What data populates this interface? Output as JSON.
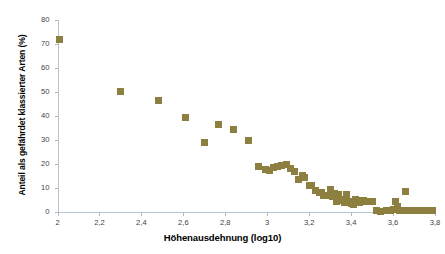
{
  "chart_data": {
    "type": "scatter",
    "title": "",
    "xlabel": "Höhenausdehnung (log10)",
    "ylabel": "Anteil als gefährdet klassierter Arten (%)",
    "xlim": [
      2,
      3.8
    ],
    "ylim": [
      0,
      80
    ],
    "grid": false,
    "legend": false,
    "marker": {
      "shape": "square",
      "color": "#8d7f40",
      "size_px": 7
    },
    "xticks": [
      2,
      2.2,
      2.4,
      2.6,
      2.8,
      3,
      3.2,
      3.4,
      3.6,
      3.8
    ],
    "xtick_labels": [
      "2",
      "2,2",
      "2,4",
      "2,6",
      "2,8",
      "3",
      "3,2",
      "3,4",
      "3,6",
      "3,8"
    ],
    "yticks": [
      0,
      10,
      20,
      30,
      40,
      50,
      60,
      70,
      80
    ],
    "ytick_labels": [
      "0",
      "10",
      "20",
      "30",
      "40",
      "50",
      "60",
      "70",
      "80"
    ],
    "series": [
      {
        "name": "Anteil gefährdeter Arten",
        "points": [
          [
            2.01,
            71.9
          ],
          [
            2.3,
            50.3
          ],
          [
            2.48,
            46.6
          ],
          [
            2.61,
            39.3
          ],
          [
            2.7,
            28.8
          ],
          [
            2.77,
            36.4
          ],
          [
            2.84,
            34.3
          ],
          [
            2.91,
            29.6
          ],
          [
            2.96,
            18.9
          ],
          [
            2.99,
            17.8
          ],
          [
            3.01,
            17.4
          ],
          [
            3.03,
            18.6
          ],
          [
            3.05,
            18.8
          ],
          [
            3.07,
            19.2
          ],
          [
            3.09,
            19.6
          ],
          [
            3.11,
            18.2
          ],
          [
            3.13,
            16.8
          ],
          [
            3.15,
            13.6
          ],
          [
            3.17,
            15.2
          ],
          [
            3.18,
            14.4
          ],
          [
            3.2,
            11.2
          ],
          [
            3.21,
            10.9
          ],
          [
            3.23,
            9.0
          ],
          [
            3.25,
            8.1
          ],
          [
            3.26,
            8.3
          ],
          [
            3.27,
            6.9
          ],
          [
            3.29,
            7.0
          ],
          [
            3.3,
            9.3
          ],
          [
            3.31,
            6.3
          ],
          [
            3.32,
            7.6
          ],
          [
            3.33,
            4.4
          ],
          [
            3.34,
            7.3
          ],
          [
            3.35,
            5.2
          ],
          [
            3.36,
            4.6
          ],
          [
            3.37,
            4.0
          ],
          [
            3.38,
            7.5
          ],
          [
            3.39,
            4.5
          ],
          [
            3.4,
            3.6
          ],
          [
            3.41,
            3.2
          ],
          [
            3.42,
            5.2
          ],
          [
            3.43,
            4.3
          ],
          [
            3.44,
            3.9
          ],
          [
            3.45,
            4.6
          ],
          [
            3.46,
            4.8
          ],
          [
            3.47,
            4.5
          ],
          [
            3.48,
            4.3
          ],
          [
            3.49,
            4.4
          ],
          [
            3.5,
            4.2
          ],
          [
            3.52,
            0.6
          ],
          [
            3.54,
            0.4
          ],
          [
            3.57,
            0.6
          ],
          [
            3.59,
            0.5
          ],
          [
            3.6,
            1.0
          ],
          [
            3.61,
            4.4
          ],
          [
            3.62,
            2.2
          ],
          [
            3.63,
            0.5
          ],
          [
            3.65,
            0.5
          ],
          [
            3.66,
            8.6
          ],
          [
            3.67,
            0.5
          ],
          [
            3.69,
            0.5
          ],
          [
            3.71,
            0.5
          ],
          [
            3.73,
            0.5
          ],
          [
            3.75,
            0.5
          ],
          [
            3.77,
            0.5
          ],
          [
            3.79,
            0.5
          ]
        ]
      }
    ]
  },
  "colors": {
    "marker": "#8d7f40",
    "y_axis_line": "#c0c0c0",
    "x_axis_line": "#b9c6d6",
    "tick_text": "#3f3f3f",
    "title_text": "#000000",
    "background": "#ffffff"
  }
}
